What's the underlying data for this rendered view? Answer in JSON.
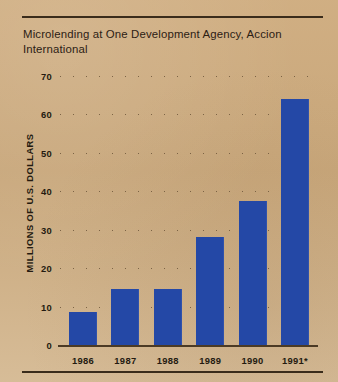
{
  "figure": {
    "title": "Microlending at One Development Agency, Accion International",
    "has_top_rule": true,
    "has_bottom_rule": true,
    "background_color": "#c9a87c",
    "ink_color": "#241a10"
  },
  "chart_data": {
    "type": "bar",
    "title": "Microlending at One Development Agency, Accion International",
    "xlabel": "",
    "ylabel": "MILLIONS OF U.S. DOLLARS",
    "categories": [
      "1986",
      "1987",
      "1988",
      "1989",
      "1990",
      "1991*"
    ],
    "values": [
      8.5,
      14.5,
      14.5,
      28,
      37.5,
      64
    ],
    "ylim": [
      0,
      70
    ],
    "yticks": [
      0,
      10,
      20,
      30,
      40,
      50,
      60,
      70
    ],
    "ytick_labels": [
      "0",
      "10",
      "20",
      "30",
      "40",
      "50",
      "60",
      "70"
    ],
    "grid": "horizontal-dotted",
    "legend": "none",
    "bar_color": "#2448a6",
    "annotations": [
      "* 1991 value marked with asterisk"
    ]
  }
}
